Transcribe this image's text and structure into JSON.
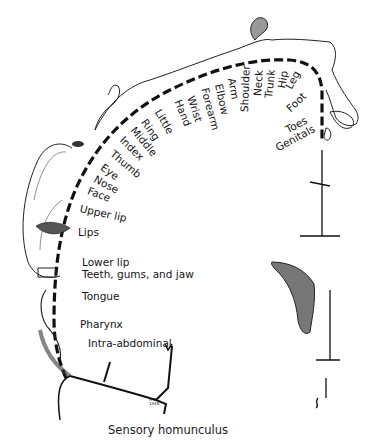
{
  "figure": {
    "caption": "Sensory homunculus",
    "artist_initials": [
      "H.T.C.",
      "1948"
    ],
    "colors": {
      "ink": "#141414",
      "background": "#ffffff"
    }
  },
  "labels": {
    "toes": "Toes",
    "genitals": "Genitals",
    "foot": "Foot",
    "leg": "Leg",
    "hip": "Hip",
    "trunk": "Trunk",
    "neck": "Neck",
    "shoulder": "Shoulder",
    "arm": "Arm",
    "elbow": "Elbow",
    "forearm": "Forearm",
    "wrist": "Wrist",
    "hand": "Hand",
    "little": "Little",
    "ring": "Ring",
    "middle": "Middle",
    "index": "Index",
    "thumb": "Thumb",
    "eye": "Eye",
    "nose": "Nose",
    "face": "Face",
    "upper_lip": "Upper lip",
    "lips": "Lips",
    "lower_lip": "Lower lip",
    "teeth_gums_jaw": "Teeth, gums, and jaw",
    "tongue": "Tongue",
    "pharynx": "Pharynx",
    "intra_abdominal": "Intra-abdominal"
  }
}
